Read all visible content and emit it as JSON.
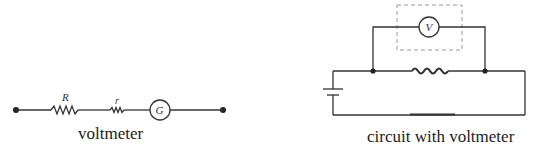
{
  "diagrams": [
    {
      "id": "voltmeter",
      "caption": "voltmeter",
      "components": {
        "resistor_R_label": "R",
        "resistor_r_label": "r",
        "galvanometer_label": "G"
      }
    },
    {
      "id": "circuit",
      "caption": "circuit with voltmeter",
      "components": {
        "voltmeter_label": "V"
      }
    }
  ],
  "colors": {
    "line": "#333333",
    "dashed_box": "#9a9a9a",
    "background": "#ffffff"
  }
}
